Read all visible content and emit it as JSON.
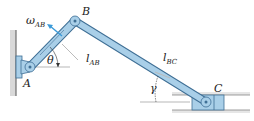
{
  "diagram": {
    "colors": {
      "link_fill": "#a9cfe8",
      "link_stroke": "#3f6f95",
      "wall": "#bfbfbf",
      "guide": "#e6e6e6",
      "arrow": "#3a9ad9",
      "text": "#222222"
    },
    "points": {
      "A": {
        "label": "A",
        "x": 30,
        "y": 67
      },
      "B": {
        "label": "B",
        "x": 75,
        "y": 21
      },
      "C": {
        "label": "C",
        "x": 206,
        "y": 102
      }
    },
    "labels": {
      "omega": {
        "main": "ω",
        "sub": "AB"
      },
      "theta": "θ",
      "gamma": "γ",
      "l_ab": {
        "main": "l",
        "sub": "AB"
      },
      "l_bc": {
        "main": "l",
        "sub": "BC"
      },
      "point_a": "A",
      "point_b": "B",
      "point_c": "C"
    },
    "links": [
      {
        "name": "AB",
        "from": "A",
        "to": "B"
      },
      {
        "name": "BC",
        "from": "B",
        "to": "C"
      }
    ]
  }
}
